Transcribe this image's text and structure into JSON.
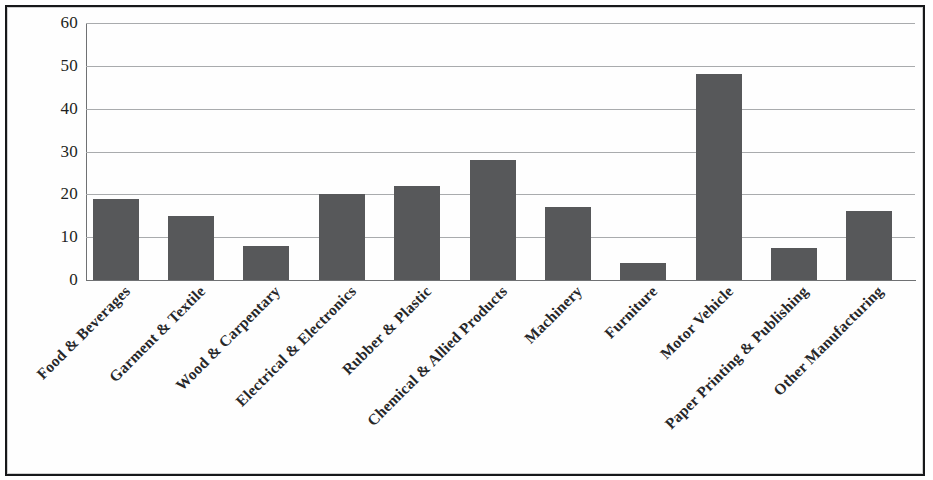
{
  "chart_data": {
    "type": "bar",
    "title": "",
    "subtitle": "",
    "xlabel": "",
    "ylabel": "",
    "ylim": [
      0,
      60
    ],
    "ytick_values": [
      60,
      50,
      40,
      30,
      20,
      10,
      0
    ],
    "ytick_labels": [
      "60",
      "50",
      "40",
      "30",
      "20",
      "10",
      "0"
    ],
    "grid": true,
    "grid_axis": "y",
    "legend": false,
    "legend_position": "none",
    "bar_color": "#57585A",
    "categories": [
      "Food & Beverages",
      "Garment & Textile",
      "Wood & Carpentary",
      "Electrical & Electronics",
      "Rubber & Plastic",
      "Chemical & Allied Products",
      "Machinery",
      "Furniture",
      "Motor Vehicle",
      "Paper Printing & Publishing",
      "Other Manufacturing"
    ],
    "values": [
      19,
      15,
      8,
      20,
      22,
      28,
      17,
      4,
      48,
      7.5,
      16
    ]
  },
  "figure": {
    "background_color": "#FFFFFF",
    "frame_color": "#17181A",
    "gridline_color": "#A9ABAD",
    "axis_color": "#6F7173"
  }
}
